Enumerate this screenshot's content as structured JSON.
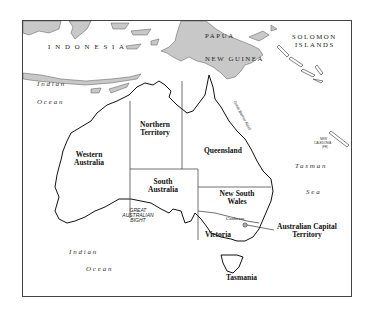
{
  "map": {
    "title": "Australia",
    "colors": {
      "land_neighbors": "#c8c8c8",
      "land_australia": "#ffffff",
      "coastline": "#111111",
      "border": "#333333",
      "frame": "#444444"
    },
    "countries": {
      "indonesia": "I N D O N E S I A",
      "papua": "PAPUA",
      "new_guinea": "NEW GUINEA",
      "solomon_1": "SOLOMON",
      "solomon_2": "ISLANDS",
      "new_caledonia_1": "NEW",
      "new_caledonia_2": "CALEDONIA",
      "new_caledonia_3": "(FR)"
    },
    "states": {
      "western_australia_1": "Western",
      "western_australia_2": "Australia",
      "northern_territory_1": "Northern",
      "northern_territory_2": "Territory",
      "queensland": "Queensland",
      "south_australia_1": "South",
      "south_australia_2": "Australia",
      "nsw_1": "New South",
      "nsw_2": "Wales",
      "victoria": "Victoria",
      "act_1": "Australian Capital",
      "act_2": "Territory",
      "tasmania": "Tasmania"
    },
    "cities": {
      "canberra": "Canberra"
    },
    "water": {
      "indian_ocean_nw_1": "Indian",
      "indian_ocean_nw_2": "Ocean",
      "indian_ocean_sw_1": "Indian",
      "indian_ocean_sw_2": "Ocean",
      "tasman_1": "Tasman",
      "tasman_2": "Sea",
      "bight_1": "GREAT",
      "bight_2": "AUSTRALIAN",
      "bight_3": "BIGHT",
      "reef": "Great Barrier Reef"
    }
  }
}
